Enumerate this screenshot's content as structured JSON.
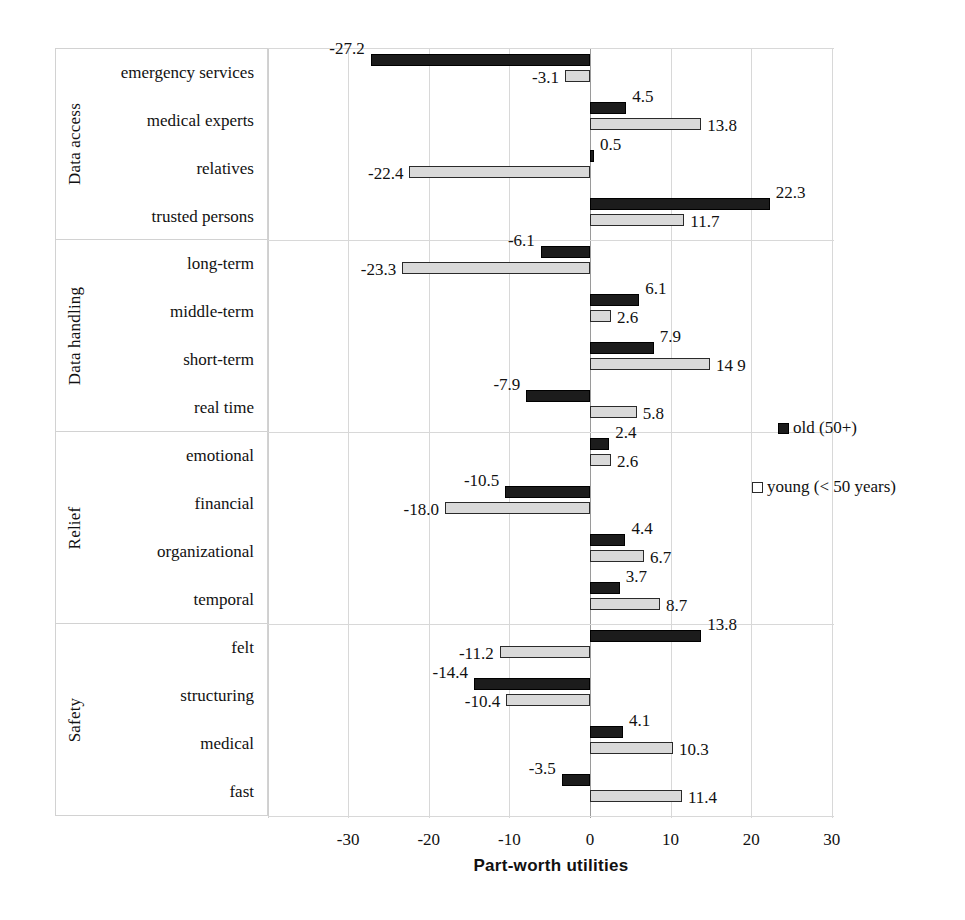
{
  "chart_data": {
    "type": "bar",
    "orientation": "horizontal",
    "title": "",
    "xlabel": "Part-worth utilities",
    "ylabel": "",
    "xlim": [
      -32,
      38
    ],
    "xticks": [
      -30,
      -20,
      -10,
      0,
      10,
      20,
      30
    ],
    "xticklabels": [
      "-30",
      "-20",
      "-10",
      "0",
      "10",
      "20",
      "30"
    ],
    "grid": true,
    "legend_position": "right-middle",
    "series": [
      {
        "name": "old (50+)",
        "key": "old",
        "color": "#1c1c1c"
      },
      {
        "name": "young (< 50 years)",
        "key": "young",
        "color": "#d9d9d9"
      }
    ],
    "groups": [
      {
        "group": "Data access",
        "categories": [
          "emergency services",
          "medical experts",
          "relatives",
          "trusted persons"
        ],
        "old": [
          -27.2,
          4.5,
          0.5,
          22.3
        ],
        "young": [
          -3.1,
          13.8,
          -22.4,
          11.7
        ],
        "old_labels": [
          "-27.2",
          "4.5",
          "0.5",
          "22.3"
        ],
        "young_labels": [
          "-3.1",
          "13.8",
          "-22.4",
          "11.7"
        ]
      },
      {
        "group": "Data handling",
        "categories": [
          "long-term",
          "middle-term",
          "short-term",
          "real time"
        ],
        "old": [
          -6.1,
          6.1,
          7.9,
          -7.9
        ],
        "young": [
          -23.3,
          2.6,
          14.9,
          5.8
        ],
        "old_labels": [
          "-6.1",
          "6.1",
          "7.9",
          "-7.9"
        ],
        "young_labels": [
          "-23.3",
          "2.6",
          "14 9",
          "5.8"
        ]
      },
      {
        "group": "Relief",
        "categories": [
          "emotional",
          "financial",
          "organizational",
          "temporal"
        ],
        "old": [
          2.4,
          -10.5,
          4.4,
          3.7
        ],
        "young": [
          2.6,
          -18.0,
          6.7,
          8.7
        ],
        "old_labels": [
          "2.4",
          "-10.5",
          "4.4",
          "3.7"
        ],
        "young_labels": [
          "2.6",
          "-18.0",
          "6.7",
          "8.7"
        ]
      },
      {
        "group": "Safety",
        "categories": [
          "felt",
          "structuring",
          "medical",
          "fast"
        ],
        "old": [
          13.8,
          -14.4,
          4.1,
          -3.5
        ],
        "young": [
          -11.2,
          -10.4,
          10.3,
          11.4
        ],
        "old_labels": [
          "13.8",
          "-14.4",
          "4.1",
          "-3.5"
        ],
        "young_labels": [
          "-11.2",
          "-10.4",
          "10.3",
          "11.4"
        ]
      }
    ]
  },
  "legend": {
    "old_label": "old (50+)",
    "young_label": "young (< 50 years)"
  },
  "axis": {
    "x_title": "Part-worth utilities"
  }
}
